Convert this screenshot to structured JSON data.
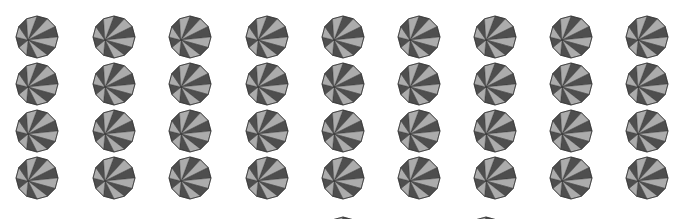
{
  "grid": {
    "columns": [
      37,
      114,
      190,
      267,
      343,
      419,
      495,
      571,
      647
    ],
    "rows": [
      37,
      84,
      131,
      178
    ],
    "extra_partial": [
      {
        "x": 343,
        "y": 238
      },
      {
        "x": 486,
        "y": 238
      }
    ],
    "radius": 21,
    "sides": 12,
    "hub_offset": {
      "dx": -9,
      "dy": 3
    }
  },
  "colors": {
    "background": "#ffffff",
    "dark_wedge": "#4e4e4e",
    "light_wedge": "#acacac",
    "outline": "#333333"
  }
}
